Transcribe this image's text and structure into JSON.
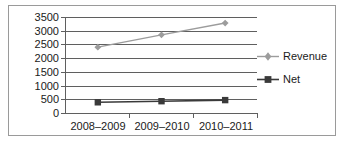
{
  "chart_data": {
    "type": "line",
    "title": "",
    "xlabel": "",
    "ylabel": "",
    "categories": [
      "2008–2009",
      "2009–2010",
      "2010–2011"
    ],
    "series": [
      {
        "name": "Revenue",
        "values": [
          2400,
          2850,
          3280
        ],
        "color": "#9c9c9c",
        "marker": "diamond"
      },
      {
        "name": "Net",
        "values": [
          390,
          430,
          470
        ],
        "color": "#3a3a3a",
        "marker": "square"
      }
    ],
    "ylim": [
      0,
      3500
    ],
    "ytick_values": [
      0,
      500,
      1000,
      1500,
      2000,
      2500,
      3000,
      3500
    ],
    "ytick_labels": [
      "0",
      "500",
      "1000",
      "1500",
      "2000",
      "2500",
      "3000",
      "3500"
    ],
    "grid": true,
    "grid_axis": "y",
    "legend": {
      "position": "right",
      "entries": [
        {
          "label": "Revenue",
          "marker": "diamond-marker",
          "color": "#9c9c9c"
        },
        {
          "label": "Net",
          "marker": "square-marker",
          "color": "#3a3a3a"
        }
      ]
    },
    "axis_color": "#5f5f5f",
    "frame_color": "#9a9a9a",
    "background": "#ffffff"
  }
}
